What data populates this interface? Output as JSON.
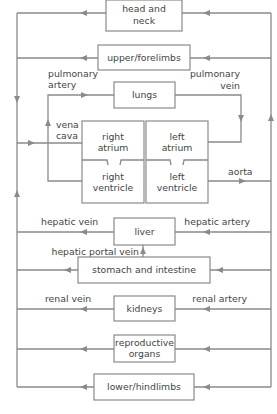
{
  "diagram": {
    "title": "",
    "line_color": "#8a8a8a",
    "text_color": "#444444",
    "organs": {
      "head_neck": [
        "head and",
        "neck"
      ],
      "upper_limbs": "upper/forelimbs",
      "lungs": "lungs",
      "right_atrium": [
        "right",
        "atrium"
      ],
      "right_ventricle": [
        "right",
        "ventricle"
      ],
      "left_atrium": [
        "left",
        "atrium"
      ],
      "left_ventricle": [
        "left",
        "ventricle"
      ],
      "liver": "liver",
      "stomach_intestine": "stomach and intestine",
      "kidneys": "kidneys",
      "reproductive": [
        "reproductive",
        "organs"
      ],
      "lower_limbs": "lower/hindlimbs"
    },
    "vessels": {
      "pulmonary_artery": [
        "pulmonary",
        "artery"
      ],
      "pulmonary_vein": [
        "pulmonary",
        "vein"
      ],
      "vena_cava": [
        "vena",
        "cava"
      ],
      "aorta": "aorta",
      "hepatic_vein": "hepatic vein",
      "hepatic_artery": "hepatic artery",
      "hepatic_portal_vein": "hepatic portal vein",
      "renal_vein": "renal vein",
      "renal_artery": "renal artery"
    }
  }
}
